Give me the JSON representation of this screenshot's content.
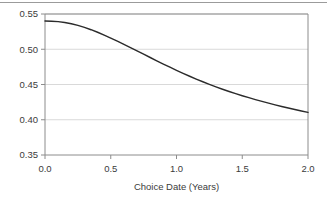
{
  "chart_data": {
    "type": "line",
    "title": "",
    "xlabel": "Choice Date (Years)",
    "ylabel": "",
    "xlim": [
      0.0,
      2.0
    ],
    "ylim": [
      0.35,
      0.55
    ],
    "xticks": [
      "0.0",
      "0.5",
      "1.0",
      "1.5",
      "2.0"
    ],
    "xtick_values": [
      0.0,
      0.5,
      1.0,
      1.5,
      2.0
    ],
    "yticks": [
      "0.35",
      "0.40",
      "0.45",
      "0.50",
      "0.55"
    ],
    "ytick_values": [
      0.35,
      0.4,
      0.45,
      0.5,
      0.55
    ],
    "grid": "horizontal",
    "legend": "none",
    "series": [
      {
        "name": "curve",
        "color": "#2b2b2b",
        "x": [
          0.0,
          0.05,
          0.1,
          0.15,
          0.2,
          0.25,
          0.3,
          0.35,
          0.4,
          0.45,
          0.5,
          0.55,
          0.6,
          0.65,
          0.7,
          0.75,
          0.8,
          0.85,
          0.9,
          0.95,
          1.0,
          1.05,
          1.1,
          1.15,
          1.2,
          1.25,
          1.3,
          1.35,
          1.4,
          1.45,
          1.5,
          1.55,
          1.6,
          1.65,
          1.7,
          1.75,
          1.8,
          1.85,
          1.9,
          1.95,
          2.0
        ],
        "y": [
          0.54,
          0.5398,
          0.5392,
          0.538,
          0.5362,
          0.5338,
          0.531,
          0.5277,
          0.5241,
          0.5201,
          0.5159,
          0.5115,
          0.507,
          0.5024,
          0.4977,
          0.493,
          0.4883,
          0.4836,
          0.479,
          0.4745,
          0.4701,
          0.4658,
          0.4617,
          0.4577,
          0.4539,
          0.4502,
          0.4467,
          0.4433,
          0.4401,
          0.437,
          0.4341,
          0.4313,
          0.4286,
          0.426,
          0.4235,
          0.4211,
          0.4188,
          0.4166,
          0.4145,
          0.4124,
          0.4104
        ]
      }
    ]
  },
  "axes": {
    "frame_color": "#808080",
    "grid_color": "#d9d9d9",
    "line_color": "#2b2b2b",
    "text_color": "#3b3b3b"
  }
}
